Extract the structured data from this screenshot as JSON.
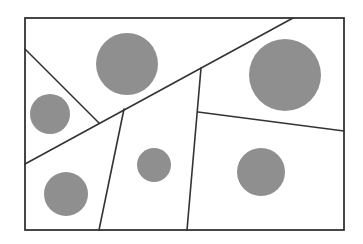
{
  "diagram": {
    "type": "partitioned-rectangle-with-circles",
    "canvas": {
      "width": 363,
      "height": 244,
      "background": "#ffffff"
    },
    "frame": {
      "x": 25,
      "y": 18,
      "width": 319,
      "height": 212,
      "stroke": "#333333"
    },
    "lines": [
      {
        "id": "main-diagonal",
        "x1": 25,
        "y1": 164,
        "x2": 293,
        "y2": 18
      },
      {
        "id": "upper-left-slant",
        "x1": 25,
        "y1": 49,
        "x2": 99,
        "y2": 123
      },
      {
        "id": "left-divider",
        "x1": 124,
        "y1": 109,
        "x2": 99,
        "y2": 230
      },
      {
        "id": "right-divider",
        "x1": 201,
        "y1": 68,
        "x2": 187,
        "y2": 230
      },
      {
        "id": "right-horizontal",
        "x1": 198,
        "y1": 112,
        "x2": 344,
        "y2": 131
      }
    ],
    "circles": [
      {
        "id": "circle-top-center",
        "cx": 127,
        "cy": 64,
        "r": 31
      },
      {
        "id": "circle-top-right",
        "cx": 285,
        "cy": 75,
        "r": 36
      },
      {
        "id": "circle-left",
        "cx": 50,
        "cy": 114,
        "r": 20
      },
      {
        "id": "circle-bottom-left",
        "cx": 66,
        "cy": 194,
        "r": 22
      },
      {
        "id": "circle-center",
        "cx": 154,
        "cy": 165,
        "r": 17
      },
      {
        "id": "circle-bottom-right",
        "cx": 261,
        "cy": 172,
        "r": 24
      }
    ],
    "colors": {
      "line": "#333333",
      "circle": "#8f8f8f"
    }
  }
}
